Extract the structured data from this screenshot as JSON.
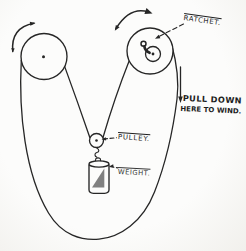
{
  "figure": {
    "type": "hand-drawn-mechanism-diagram",
    "labels": {
      "ratchet": "RATCHET.",
      "pull_down_line1": "PULL DOWN",
      "pull_down_line2": "HERE TO WIND.",
      "pulley": "PULLEY.",
      "weight": "WEIGHT."
    },
    "colors": {
      "ink": "#262626",
      "paper": "#fcfcfb",
      "paper_edge": "#f1f0ec",
      "shading": "#6a6a6a"
    }
  }
}
